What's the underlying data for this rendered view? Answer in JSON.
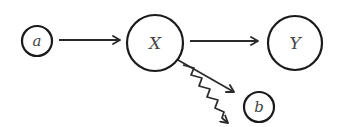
{
  "diagram": {
    "type": "causal-graph",
    "nodes": [
      {
        "id": "a",
        "label": "a",
        "cx": 37,
        "cy": 41,
        "r": 15,
        "font_size": 15
      },
      {
        "id": "X",
        "label": "X",
        "cx": 155,
        "cy": 43,
        "r": 28,
        "font_size": 17
      },
      {
        "id": "Y",
        "label": "Y",
        "cx": 295,
        "cy": 43,
        "r": 27,
        "font_size": 17
      },
      {
        "id": "b",
        "label": "b",
        "cx": 259,
        "cy": 107,
        "r": 15,
        "font_size": 15
      }
    ],
    "edges": [
      {
        "id": "a-to-X",
        "from": "a",
        "to": "X",
        "style": "straight-arrow"
      },
      {
        "id": "X-to-Y",
        "from": "X",
        "to": "Y",
        "style": "straight-arrow"
      },
      {
        "id": "X-to-b",
        "from": "X",
        "to": "b",
        "style": "straight-arrow"
      },
      {
        "id": "X-wavy",
        "from": "X",
        "to": null,
        "style": "wavy-arrow"
      }
    ],
    "colors": {
      "stroke": "#1a1a1a",
      "label": "#444444",
      "background": "#ffffff"
    }
  }
}
